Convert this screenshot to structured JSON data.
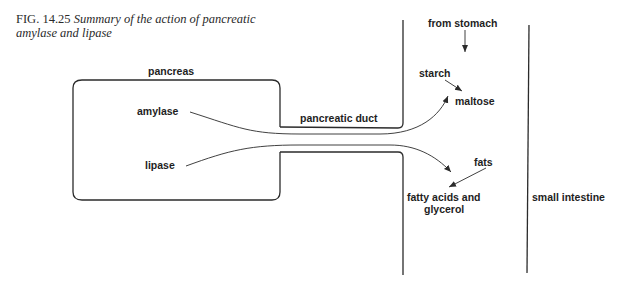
{
  "caption": {
    "fig_prefix": "FIG.",
    "fig_number": "14.25",
    "text": "Summary of the action of pancreatic amylase and lipase"
  },
  "labels": {
    "pancreas": "pancreas",
    "amylase": "amylase",
    "lipase": "lipase",
    "pancreatic_duct": "pancreatic duct",
    "from_stomach": "from stomach",
    "starch": "starch",
    "maltose": "maltose",
    "fats": "fats",
    "fatty_acids_line1": "fatty acids and",
    "fatty_acids_line2": "glycerol",
    "small_intestine": "small intestine"
  },
  "colors": {
    "line": "#2b2b2b",
    "text": "#1e1e1e"
  }
}
